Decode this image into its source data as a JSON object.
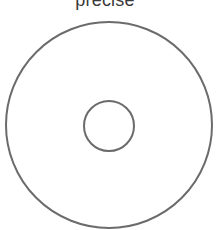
{
  "canvas": {
    "width": 224,
    "height": 230,
    "background_color": "#ffffff"
  },
  "title": {
    "text": "precise",
    "color": "#3a3a3a",
    "font_size_px": 18,
    "clipped_at_top": true
  },
  "figure": {
    "name": "concentric-circles-annulus",
    "stroke_color": "#6b6b6b",
    "fill": "none",
    "outer_circle": {
      "label": "outer-circle",
      "center_x": 109,
      "center_y": 125,
      "radius": 103,
      "stroke_width": 2
    },
    "inner_circle": {
      "label": "inner-circle",
      "center_x": 109,
      "center_y": 126,
      "radius": 25,
      "stroke_width": 2
    }
  }
}
